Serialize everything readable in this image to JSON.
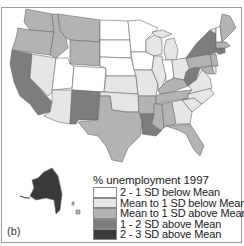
{
  "figure": {
    "panel_label": "(b)"
  },
  "legend": {
    "title": "% unemployment 1997",
    "items": [
      {
        "label": "2 - 1 SD below Mean",
        "color": "#ffffff"
      },
      {
        "label": "Mean to 1 SD below Mean",
        "color": "#e6e6e6"
      },
      {
        "label": "Mean to 1 SD above Mean",
        "color": "#b3b3b3"
      },
      {
        "label": "1 - 2 SD above Mean",
        "color": "#7d7d7d"
      },
      {
        "label": "2 - 3 SD above Mean",
        "color": "#3a3a3a"
      }
    ]
  },
  "map_data": {
    "title": "% unemployment 1997",
    "classes": [
      "2 - 1 SD below Mean",
      "Mean to 1 SD below Mean",
      "Mean to 1 SD above Mean",
      "1 - 2 SD above Mean",
      "2 - 3 SD above Mean"
    ],
    "states": {
      "WA": 2,
      "OR": 2,
      "CA": 3,
      "NV": 1,
      "ID": 2,
      "MT": 2,
      "WY": 2,
      "UT": 0,
      "CO": 0,
      "AZ": 1,
      "NM": 3,
      "ND": 0,
      "SD": 0,
      "NE": 0,
      "KS": 1,
      "OK": 1,
      "TX": 2,
      "MN": 0,
      "IA": 0,
      "MO": 1,
      "AR": 2,
      "LA": 3,
      "WI": 1,
      "IL": 1,
      "MI": 1,
      "IN": 0,
      "OH": 1,
      "KY": 2,
      "TN": 2,
      "MS": 2,
      "AL": 2,
      "GA": 1,
      "FL": 2,
      "SC": 1,
      "NC": 1,
      "VA": 1,
      "WV": 3,
      "PA": 2,
      "NY": 3,
      "ME": 2,
      "VT": 1,
      "NH": 0,
      "MA": 2,
      "CT": 3,
      "RI": 3,
      "NJ": 2,
      "DE": 1,
      "MD": 2,
      "AK": 4,
      "HI": 2
    }
  }
}
